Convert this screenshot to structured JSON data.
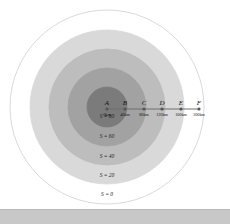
{
  "diagram": {
    "center": {
      "x": 107,
      "y": 107
    },
    "rings": [
      {
        "label": "S = 0",
        "radius": 97,
        "fill": "#ffffff",
        "stroke": "#cfcfcf",
        "label_y": 196
      },
      {
        "label": "S = 20",
        "radius": 77,
        "fill": "#d9d9d9",
        "stroke": "#d9d9d9",
        "label_y": 177
      },
      {
        "label": "S = 40",
        "radius": 58,
        "fill": "#bdbdbd",
        "stroke": "#bdbdbd",
        "label_y": 158
      },
      {
        "label": "S = 60",
        "radius": 39,
        "fill": "#a2a2a2",
        "stroke": "#a2a2a2",
        "label_y": 138
      },
      {
        "label": "S = 80",
        "radius": 20,
        "fill": "#7b7b7b",
        "stroke": "#7b7b7b",
        "label_y": 118
      }
    ],
    "points": [
      {
        "name": "A",
        "distance": "0km",
        "x": 107
      },
      {
        "name": "B",
        "distance": "40km",
        "x": 125
      },
      {
        "name": "C",
        "distance": "80km",
        "x": 144
      },
      {
        "name": "D",
        "distance": "120km",
        "x": 162
      },
      {
        "name": "E",
        "distance": "160km",
        "x": 181
      },
      {
        "name": "F",
        "distance": "200km",
        "x": 199
      }
    ],
    "line_y": 109,
    "line_color": "#6e6e6e"
  },
  "bottom_bar": {
    "color": "#c8c8c8"
  }
}
